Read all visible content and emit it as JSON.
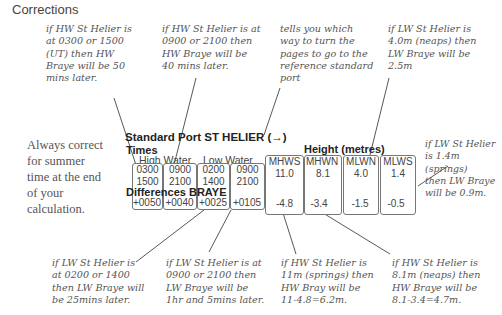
{
  "title": "Corrections",
  "side_note": [
    "Always correct",
    "for summer",
    "time at the end",
    "of your",
    "calculation."
  ],
  "table": {
    "header": "Standard Port ST HELIER (→)",
    "times_label": "Times",
    "high_water_label": "High Water",
    "low_water_label": "Low Water",
    "differences_label": "Differences BRAYE",
    "height_label": "Height (metres)",
    "time_columns": [
      {
        "times": [
          "0300",
          "1500"
        ],
        "difference": "+0050"
      },
      {
        "times": [
          "0900",
          "2100"
        ],
        "difference": "+0040"
      },
      {
        "times": [
          "0200",
          "1400"
        ],
        "difference": "+0025"
      },
      {
        "times": [
          "0900",
          "2100"
        ],
        "difference": "+0105"
      }
    ],
    "height_columns": [
      {
        "name": "MHWS",
        "height": "11.0",
        "difference": "-4.8"
      },
      {
        "name": "MHWN",
        "height": "8.1",
        "difference": "-3.4"
      },
      {
        "name": "MLWN",
        "height": "4.0",
        "difference": "-1.5"
      },
      {
        "name": "MLWS",
        "height": "1.4",
        "difference": "-0.5"
      }
    ]
  },
  "annotations": {
    "hw_0300": [
      "if HW St Helier is",
      "at 0300 or 1500",
      "(UT) then HW",
      "Braye will be 50",
      "mins later."
    ],
    "hw_0900": [
      "if HW St Helier is at",
      "0900 or 2100 then",
      "HW Braye will be",
      "40 mins later."
    ],
    "arrow": [
      "tells you which",
      "way to turn the",
      "pages to go to the",
      "reference standard",
      "port"
    ],
    "lw_neaps": [
      "if LW St Helier is",
      "4.0m (neaps) then",
      "LW Braye will be",
      "2.5m"
    ],
    "lw_springs": [
      "if LW St Helier",
      "is 1.4m (springs)",
      "then LW Braye",
      "will be 0.9m."
    ],
    "lw_0200": [
      "if LW St Helier is",
      "at 0200 or 1400",
      "then LW Braye will",
      "be 25mins later."
    ],
    "lw_0900": [
      "if LW St Helier is at",
      "0900 or 2100 then",
      "LW Braye will be",
      "1hr and 5mins later."
    ],
    "hw_springs": [
      "if HW St Helier is",
      "11m (springs) then",
      "HW Bray will be",
      "11-4.8=6.2m."
    ],
    "hw_neaps": [
      "if HW St Helier is",
      "8.1m (neaps) then",
      "HW Braye will be",
      "8.1-3.4=4.7m."
    ]
  }
}
